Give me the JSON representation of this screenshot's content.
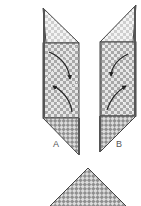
{
  "diagram": {
    "type": "origami-fold-instructions",
    "labels": {
      "strip_a": "A",
      "strip_b": "B"
    },
    "colors": {
      "outline": "#444444",
      "checker_light": "#e6e6e6",
      "checker_dark": "#a8a8a8",
      "light_checker_light": "#f4f4f4",
      "light_checker_dark": "#cfcfcf",
      "arrow": "#222222",
      "dash": "#ffffff"
    },
    "elements": [
      {
        "id": "strip-a",
        "description": "Left folded strip with top triangle, checkered body, curved fold arrows, bottom triangle",
        "label": "A"
      },
      {
        "id": "strip-b",
        "description": "Right folded strip mirrored, with curved fold arrows",
        "label": "B"
      },
      {
        "id": "bottom-triangle",
        "description": "Checkered triangle result shape at bottom"
      }
    ]
  }
}
